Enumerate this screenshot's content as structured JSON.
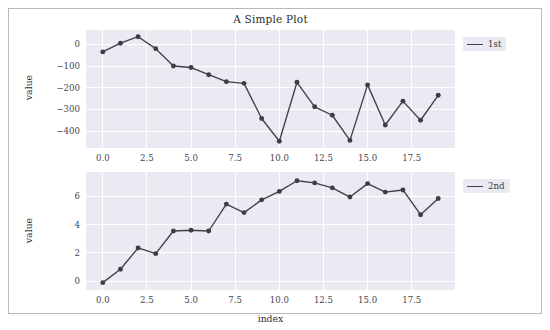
{
  "figure": {
    "title": "A Simple Plot",
    "width": 550,
    "height": 330,
    "background": "#ffffff",
    "panel_background": "#eaeaf2",
    "grid_color": "#ffffff",
    "line_color": "#40404a",
    "marker_color": "#3d3d46",
    "border_color": "#b9b9b9"
  },
  "panels": [
    {
      "name": "top",
      "title": "A Simple Plot",
      "ylabel": "value",
      "xlabel": "",
      "legend_label": "1st",
      "ytick_labels": [
        "0",
        "-100",
        "-200",
        "-300",
        "-400"
      ],
      "xtick_labels": [
        "0.0",
        "2.5",
        "5.0",
        "7.5",
        "10.0",
        "12.5",
        "15.0",
        "17.5"
      ],
      "xtick_values": [
        0,
        2.5,
        5,
        7.5,
        10,
        12.5,
        15,
        17.5
      ],
      "ytick_values": [
        0,
        -100,
        -200,
        -300,
        -400
      ]
    },
    {
      "name": "bottom",
      "title": "",
      "ylabel": "value",
      "xlabel": "index",
      "legend_label": "2nd",
      "ytick_labels": [
        "0",
        "2",
        "4",
        "6"
      ],
      "xtick_labels": [
        "0.0",
        "2.5",
        "5.0",
        "7.5",
        "10.0",
        "12.5",
        "15.0",
        "17.5"
      ],
      "xtick_values": [
        0,
        2.5,
        5,
        7.5,
        10,
        12.5,
        15,
        17.5
      ],
      "ytick_values": [
        0,
        2,
        4,
        6
      ]
    }
  ],
  "chart_data": [
    {
      "type": "line",
      "title": "A Simple Plot",
      "xlabel": "",
      "ylabel": "value",
      "legend_position": "upper right",
      "grid": true,
      "xlim": [
        -0.95,
        19.95
      ],
      "ylim": [
        -478,
        66
      ],
      "xticks": [
        0,
        2.5,
        5,
        7.5,
        10,
        12.5,
        15,
        17.5
      ],
      "yticks": [
        0,
        -100,
        -200,
        -300,
        -400
      ],
      "series": [
        {
          "name": "1st",
          "marker": "o",
          "color": "#40404a",
          "x": [
            0,
            1,
            2,
            3,
            4,
            5,
            6,
            7,
            8,
            9,
            10,
            11,
            12,
            13,
            14,
            15,
            16,
            17,
            18,
            19
          ],
          "values": [
            -35,
            5,
            35,
            -20,
            -100,
            -107,
            -140,
            -172,
            -180,
            -342,
            -447,
            -175,
            -288,
            -327,
            -443,
            -187,
            -372,
            -262,
            -350,
            -235
          ]
        }
      ]
    },
    {
      "type": "line",
      "title": "",
      "xlabel": "index",
      "ylabel": "value",
      "legend_position": "upper right",
      "grid": true,
      "xlim": [
        -0.95,
        19.95
      ],
      "ylim": [
        -0.62,
        7.72
      ],
      "xticks": [
        0,
        2.5,
        5,
        7.5,
        10,
        12.5,
        15,
        17.5
      ],
      "yticks": [
        0,
        2,
        4,
        6
      ],
      "series": [
        {
          "name": "2nd",
          "marker": "o",
          "color": "#40404a",
          "x": [
            0,
            1,
            2,
            3,
            4,
            5,
            6,
            7,
            8,
            9,
            10,
            11,
            12,
            13,
            14,
            15,
            16,
            17,
            18,
            19
          ],
          "values": [
            -0.1,
            0.85,
            2.35,
            1.95,
            3.55,
            3.6,
            3.55,
            5.45,
            4.85,
            5.75,
            6.35,
            7.1,
            6.95,
            6.6,
            5.95,
            6.9,
            6.3,
            6.45,
            4.7,
            5.85
          ]
        }
      ]
    }
  ]
}
